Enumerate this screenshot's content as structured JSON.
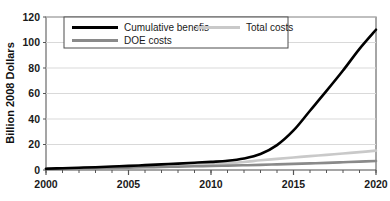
{
  "chart_data": {
    "type": "line",
    "title": "",
    "xlabel": "",
    "ylabel": "Billion 2008 Dollars",
    "xlim": [
      2000,
      2020
    ],
    "ylim": [
      0,
      120
    ],
    "grid": "horizontal",
    "legend_position": "top-inside",
    "xticks": [
      "2000",
      "2005",
      "2010",
      "2015",
      "2020"
    ],
    "xtick_values": [
      2000,
      2005,
      2010,
      2015,
      2020
    ],
    "yticks": [
      "0",
      "20",
      "40",
      "60",
      "80",
      "100",
      "120"
    ],
    "ytick_values": [
      0,
      20,
      40,
      60,
      80,
      100,
      120
    ],
    "minor_xticks_every": 1,
    "x": [
      2000,
      2001,
      2002,
      2003,
      2004,
      2005,
      2006,
      2007,
      2008,
      2009,
      2010,
      2011,
      2012,
      2013,
      2014,
      2015,
      2016,
      2017,
      2018,
      2019,
      2020
    ],
    "series": [
      {
        "name": "Cumulative benefis",
        "color": "#000000",
        "width": 2.6,
        "style": "solid",
        "values": [
          1.0,
          1.4,
          1.8,
          2.2,
          2.7,
          3.2,
          3.8,
          4.4,
          5.0,
          5.7,
          6.4,
          7.2,
          9.0,
          12.5,
          19.5,
          31.0,
          46.5,
          62.0,
          78.0,
          95.0,
          110.0
        ]
      },
      {
        "name": "Total costs",
        "color": "#c9c9c9",
        "width": 2.6,
        "style": "solid",
        "values": [
          1.0,
          1.3,
          1.6,
          1.9,
          2.2,
          2.5,
          2.9,
          3.3,
          3.7,
          4.1,
          4.6,
          5.3,
          6.3,
          7.6,
          8.7,
          9.8,
          10.9,
          11.9,
          13.0,
          14.0,
          15.2
        ]
      },
      {
        "name": "DOE costs",
        "color": "#8a8a8a",
        "width": 2.6,
        "style": "solid",
        "values": [
          0.9,
          1.1,
          1.3,
          1.5,
          1.7,
          1.9,
          2.1,
          2.4,
          2.6,
          2.9,
          3.1,
          3.4,
          3.7,
          4.0,
          4.4,
          4.8,
          5.2,
          5.6,
          6.1,
          6.6,
          7.0
        ]
      }
    ]
  },
  "legend": {
    "entries": [
      {
        "label": "Cumulative benefis",
        "swatch": "#000000"
      },
      {
        "label": "Total costs",
        "swatch": "#c9c9c9"
      },
      {
        "label": "DOE costs",
        "swatch": "#8a8a8a"
      }
    ]
  },
  "colors": {
    "axis": "#555555",
    "grid": "#d9d9d9",
    "frame": "#4d4d4d",
    "text": "#1a1a1a",
    "background": "#ffffff"
  }
}
